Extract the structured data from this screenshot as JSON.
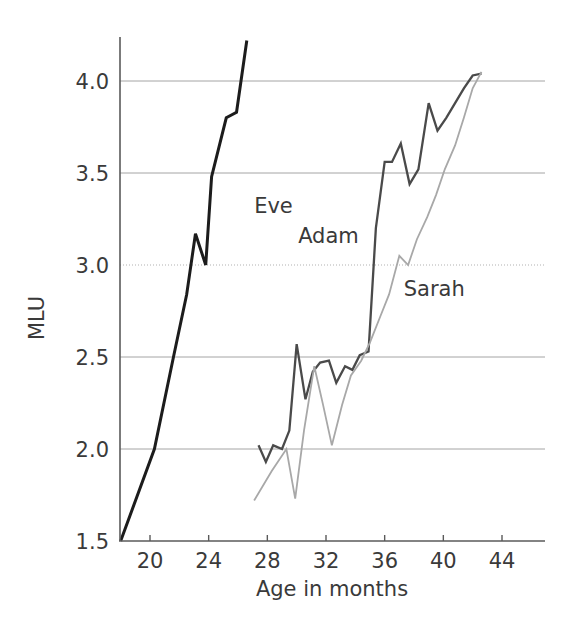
{
  "chart_data": {
    "type": "line",
    "title": "",
    "xlabel": "Age in months",
    "ylabel": "MLU",
    "xlim": [
      18,
      46
    ],
    "ylim": [
      1.5,
      4.3
    ],
    "xticks": [
      20,
      24,
      28,
      32,
      36,
      40,
      44
    ],
    "xtick_labels": [
      "20",
      "24",
      "28",
      "32",
      "36",
      "40",
      "44"
    ],
    "yticks": [
      1.5,
      2.0,
      2.5,
      3.0,
      3.5,
      4.0
    ],
    "ytick_labels": [
      "1.5",
      "2.0",
      "2.5",
      "3.0",
      "3.5",
      "4.0"
    ],
    "grid": true,
    "grid_axis": "y",
    "legend_position": "inline-labels",
    "series": [
      {
        "name": "Eve",
        "color": "#1c1c1c",
        "label_x": 27.1,
        "label_y": 3.28,
        "x": [
          18.0,
          20.3,
          21.6,
          22.5,
          23.1,
          23.8,
          24.2,
          25.2,
          25.9,
          26.6
        ],
        "y": [
          1.5,
          2.0,
          2.5,
          2.84,
          3.17,
          3.0,
          3.48,
          3.8,
          3.83,
          4.22
        ]
      },
      {
        "name": "Adam",
        "color": "#4a4a4a",
        "label_x": 30.1,
        "label_y": 3.12,
        "x": [
          27.4,
          27.9,
          28.4,
          29.0,
          29.5,
          30.0,
          30.6,
          31.1,
          31.6,
          32.2,
          32.7,
          33.3,
          33.8,
          34.3,
          34.9,
          35.4,
          36.0,
          36.5,
          37.1,
          37.7,
          38.3,
          39.0,
          39.6,
          40.2,
          40.8,
          41.4,
          42.0,
          42.6
        ],
        "y": [
          2.02,
          1.93,
          2.02,
          2.0,
          2.1,
          2.57,
          2.27,
          2.42,
          2.47,
          2.48,
          2.36,
          2.45,
          2.43,
          2.51,
          2.53,
          3.2,
          3.56,
          3.56,
          3.66,
          3.44,
          3.52,
          3.88,
          3.73,
          3.8,
          3.88,
          3.96,
          4.03,
          4.04
        ]
      },
      {
        "name": "Sarah",
        "color": "#a8a8a8",
        "label_x": 37.3,
        "label_y": 2.83,
        "x": [
          27.1,
          28.3,
          29.3,
          29.9,
          30.5,
          31.2,
          31.8,
          32.4,
          33.1,
          33.7,
          34.4,
          35.0,
          35.7,
          36.3,
          37.0,
          37.6,
          38.2,
          38.9,
          39.5,
          40.1,
          40.8,
          41.4,
          42.0,
          42.6
        ],
        "y": [
          1.72,
          1.88,
          2.0,
          1.73,
          2.1,
          2.45,
          2.24,
          2.02,
          2.24,
          2.4,
          2.48,
          2.58,
          2.72,
          2.84,
          3.05,
          3.0,
          3.14,
          3.26,
          3.38,
          3.52,
          3.65,
          3.8,
          3.96,
          4.05
        ]
      }
    ]
  },
  "axes": {
    "y_label_text": "MLU",
    "x_label_text": "Age in months"
  }
}
